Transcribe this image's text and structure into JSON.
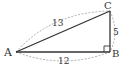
{
  "diagram": {
    "type": "right-triangle",
    "vertices": {
      "A": {
        "label": "A",
        "x": 16,
        "y": 52
      },
      "B": {
        "label": "B",
        "x": 110,
        "y": 52
      },
      "C": {
        "label": "C",
        "x": 110,
        "y": 11
      }
    },
    "right_angle_at": "B",
    "sides": {
      "AC": {
        "label": "13"
      },
      "BC": {
        "label": "5"
      },
      "AB": {
        "label": "12"
      }
    },
    "colors": {
      "line": "#333333",
      "dashed": "#999999",
      "background": "#ffffff"
    }
  }
}
